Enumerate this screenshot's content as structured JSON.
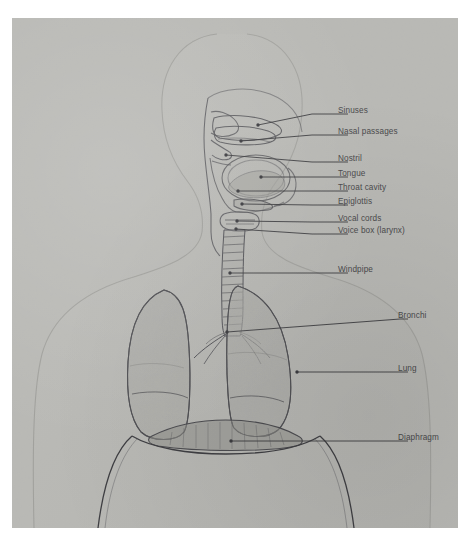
{
  "figure": {
    "plate_background": "#b9b9b5",
    "ink_color": "#4a4a4c"
  },
  "labels": [
    {
      "id": "sinuses",
      "text": "Sinuses",
      "x": 338,
      "y": 93,
      "leader_x1": 300,
      "leader_y1": 96,
      "point_x": 246,
      "point_y": 107
    },
    {
      "id": "nasal",
      "text": "Nasal passages",
      "x": 338,
      "y": 114,
      "leader_x1": 300,
      "leader_y1": 117,
      "point_x": 229,
      "point_y": 123
    },
    {
      "id": "nostril",
      "text": "Nostril",
      "x": 338,
      "y": 141,
      "leader_x1": 300,
      "leader_y1": 144,
      "point_x": 214,
      "point_y": 137
    },
    {
      "id": "tongue",
      "text": "Tongue",
      "x": 338,
      "y": 156,
      "leader_x1": 300,
      "leader_y1": 159,
      "point_x": 249,
      "point_y": 159
    },
    {
      "id": "throat",
      "text": "Throat cavity",
      "x": 338,
      "y": 170,
      "leader_x1": 300,
      "leader_y1": 173,
      "point_x": 226,
      "point_y": 173
    },
    {
      "id": "epiglottis",
      "text": "Epiglottis",
      "x": 338,
      "y": 184,
      "leader_x1": 300,
      "leader_y1": 187,
      "point_x": 230,
      "point_y": 186
    },
    {
      "id": "vocal-cords",
      "text": "Vocal cords",
      "x": 338,
      "y": 201,
      "leader_x1": 300,
      "leader_y1": 204,
      "point_x": 225,
      "point_y": 203
    },
    {
      "id": "voice-box",
      "text": "Voice box (larynx)",
      "x": 338,
      "y": 213,
      "leader_x1": 300,
      "leader_y1": 216,
      "point_x": 224,
      "point_y": 211
    },
    {
      "id": "windpipe",
      "text": "Windpipe",
      "x": 338,
      "y": 252,
      "leader_x1": 300,
      "leader_y1": 255,
      "point_x": 218,
      "point_y": 255
    },
    {
      "id": "bronchi",
      "text": "Bronchi",
      "x": 398,
      "y": 298,
      "leader_x1": 388,
      "leader_y1": 301,
      "point_x": 215,
      "point_y": 314
    },
    {
      "id": "lung",
      "text": "Lung",
      "x": 398,
      "y": 351,
      "leader_x1": 388,
      "leader_y1": 354,
      "point_x": 285,
      "point_y": 354
    },
    {
      "id": "diaphragm",
      "text": "Diaphragm",
      "x": 398,
      "y": 420,
      "leader_x1": 388,
      "leader_y1": 423,
      "point_x": 219,
      "point_y": 423
    }
  ],
  "anatomy_parts": [
    {
      "id": "body-silhouette",
      "name": "head and torso silhouette"
    },
    {
      "id": "nasal-cavity",
      "name": "nasal passages"
    },
    {
      "id": "oral-cavity",
      "name": "throat cavity and tongue"
    },
    {
      "id": "larynx",
      "name": "voice box"
    },
    {
      "id": "trachea",
      "name": "windpipe"
    },
    {
      "id": "bronchus-left",
      "name": "left bronchus"
    },
    {
      "id": "bronchus-right",
      "name": "right bronchus"
    },
    {
      "id": "lung-left",
      "name": "left lung"
    },
    {
      "id": "lung-right",
      "name": "right lung"
    },
    {
      "id": "diaphragm-dome",
      "name": "diaphragm"
    },
    {
      "id": "ribcage",
      "name": "rib cage outline"
    }
  ]
}
